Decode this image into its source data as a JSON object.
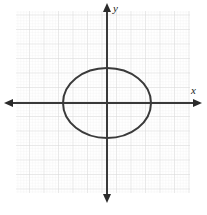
{
  "figure": {
    "title": "",
    "width": 207,
    "height": 215,
    "background_color": "#ffffff"
  },
  "axes": {
    "x_label": "x",
    "y_label": "y",
    "axis_color": "#3a3a3a",
    "origin": {
      "x": 107,
      "y": 103
    },
    "x_axis": {
      "start_x": 8,
      "end_x": 198,
      "y": 103,
      "arrows": "both"
    },
    "y_axis": {
      "x": 107,
      "start_y": 5,
      "end_y": 201,
      "arrows": "both"
    }
  },
  "grid": {
    "left": 16,
    "top": 11,
    "right": 190,
    "bottom": 193,
    "major_spacing": 14.5,
    "minor_spacing": 2.9,
    "major_color": "#d8d8d8",
    "minor_color": "#ececec",
    "style": "dotted"
  },
  "chart_data": {
    "type": "scatter",
    "title": "",
    "xlabel": "x",
    "ylabel": "y",
    "grid": true,
    "legend": "none",
    "xlim": [
      -6.25,
      5.75
    ],
    "ylim": [
      -6.2,
      6.35
    ],
    "annotations": [],
    "series": [
      {
        "name": "ellipse",
        "shape": "ellipse",
        "center": [
          0,
          0
        ],
        "semi_axis_x": 3.0,
        "semi_axis_y": 2.4,
        "equation": "x^2/9 + y^2/5.76 = 1",
        "stroke_color": "#3a3a3a",
        "stroke_width": 2,
        "fill": "none",
        "x_intercepts": [
          -3.0,
          3.0
        ],
        "y_intercepts": [
          -2.4,
          2.4
        ],
        "pixel_center": [
          107,
          103
        ],
        "pixel_radius_x": 44,
        "pixel_radius_y": 35
      }
    ]
  }
}
